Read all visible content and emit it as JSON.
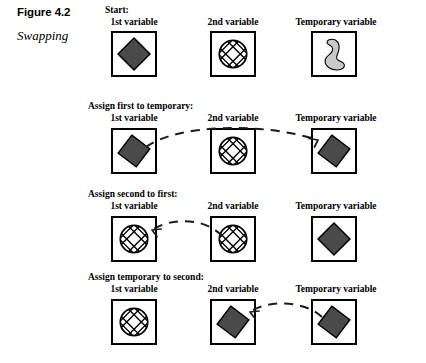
{
  "figure": {
    "number": "Figure 4.2",
    "title": "Swapping"
  },
  "columns": {
    "first": "1st variable",
    "second": "2nd variable",
    "temp": "Temporary variable"
  },
  "colors": {
    "diamond_fill": "#4a4a4a",
    "diamond_stroke": "#000000",
    "blob_fill": "#c9c9c9",
    "blob_stroke": "#000000",
    "hatch_stroke": "#000000",
    "box_border": "#000000",
    "arrow": "#1a1a1a",
    "page_background": "#ffffff"
  },
  "rows": [
    {
      "step_label": "Start:",
      "cells": [
        {
          "column": "1st variable",
          "icon": "dark-diamond-icon"
        },
        {
          "column": "2nd variable",
          "icon": "hatched-circle-icon"
        },
        {
          "column": "Temporary variable",
          "icon": "gray-blob-icon"
        }
      ],
      "arrow": null
    },
    {
      "step_label": "Assign first to temporary:",
      "cells": [
        {
          "column": "1st variable",
          "icon": "dark-diamond-icon"
        },
        {
          "column": "2nd variable",
          "icon": "hatched-circle-icon"
        },
        {
          "column": "Temporary variable",
          "icon": "dark-diamond-icon"
        }
      ],
      "arrow": {
        "from": "1st variable",
        "to": "Temporary variable",
        "style": "dashed-curved"
      }
    },
    {
      "step_label": "Assign second to first:",
      "cells": [
        {
          "column": "1st variable",
          "icon": "hatched-circle-icon"
        },
        {
          "column": "2nd variable",
          "icon": "hatched-circle-icon"
        },
        {
          "column": "Temporary variable",
          "icon": "dark-diamond-icon"
        }
      ],
      "arrow": {
        "from": "2nd variable",
        "to": "1st variable",
        "style": "dashed-curved"
      }
    },
    {
      "step_label": "Assign temporary to second:",
      "cells": [
        {
          "column": "1st variable",
          "icon": "hatched-circle-icon"
        },
        {
          "column": "2nd variable",
          "icon": "dark-diamond-icon"
        },
        {
          "column": "Temporary variable",
          "icon": "dark-diamond-icon"
        }
      ],
      "arrow": {
        "from": "Temporary variable",
        "to": "2nd variable",
        "style": "dashed-curved"
      }
    }
  ]
}
